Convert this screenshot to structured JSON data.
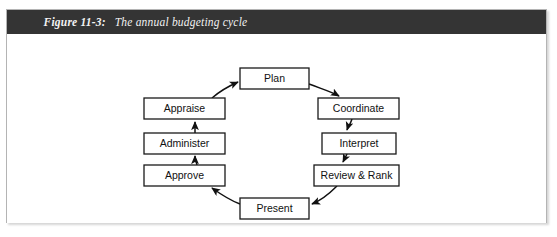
{
  "figure": {
    "label": "Figure 11-3:",
    "title": "The annual budgeting cycle",
    "caption_full": "Figure 11-3:  The annual budgeting cycle"
  },
  "colors": {
    "caption_bar": "#343434",
    "caption_text": "#f2f2f2",
    "frame_border": "#b4b4b4",
    "box_stroke": "#1a1a1a",
    "box_fill": "#ffffff",
    "arrow_stroke": "#111111",
    "page_background": "#ffffff"
  },
  "chart_data": {
    "type": "diagram",
    "diagram_kind": "cycle-flow",
    "direction": "clockwise-from-plan",
    "title": "The annual budgeting cycle",
    "nodes": [
      {
        "id": "plan",
        "label": "Plan",
        "x": 233,
        "y": 34,
        "w": 69,
        "h": 21
      },
      {
        "id": "coordinate",
        "label": "Coordinate",
        "x": 311,
        "y": 64,
        "w": 81,
        "h": 21
      },
      {
        "id": "interpret",
        "label": "Interpret",
        "x": 315,
        "y": 99,
        "w": 74,
        "h": 21
      },
      {
        "id": "review_rank",
        "label": "Review & Rank",
        "x": 307,
        "y": 131,
        "w": 85,
        "h": 21
      },
      {
        "id": "present",
        "label": "Present",
        "x": 233,
        "y": 164,
        "w": 69,
        "h": 21
      },
      {
        "id": "approve",
        "label": "Approve",
        "x": 137,
        "y": 131,
        "w": 81,
        "h": 21
      },
      {
        "id": "administer",
        "label": "Administer",
        "x": 137,
        "y": 99,
        "w": 81,
        "h": 21
      },
      {
        "id": "appraise",
        "label": "Appraise",
        "x": 137,
        "y": 64,
        "w": 81,
        "h": 21
      }
    ],
    "edges": [
      {
        "from": "plan",
        "to": "coordinate",
        "path": "M 302 50 C 318 56 325 58 332 62"
      },
      {
        "from": "coordinate",
        "to": "interpret",
        "path": "M 345 85 C 343 91 341 93 340 96"
      },
      {
        "from": "interpret",
        "to": "review_rank",
        "path": "M 340 120 C 338 124 337 126 336 128"
      },
      {
        "from": "review_rank",
        "to": "present",
        "path": "M 330 152 C 320 162 310 168 305 170"
      },
      {
        "from": "present",
        "to": "approve",
        "path": "M 233 170 C 222 166 212 159 205 154"
      },
      {
        "from": "approve",
        "to": "administer",
        "path": "M 190 131 C 189 127 188 125 188 122"
      },
      {
        "from": "administer",
        "to": "appraise",
        "path": "M 188 99 C 188 95 188 92 188 88"
      },
      {
        "from": "appraise",
        "to": "plan",
        "path": "M 205 64 C 213 57 222 52 231 48"
      }
    ]
  }
}
